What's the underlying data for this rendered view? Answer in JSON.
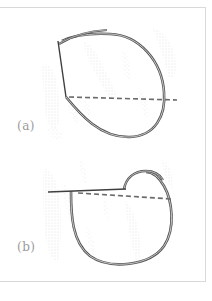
{
  "figure": {
    "panels": [
      {
        "id": "a",
        "label": "(a)",
        "description": "Open loop with straight vertical segment and horizontal dashed reference line"
      },
      {
        "id": "b",
        "label": "(b)",
        "description": "Closed loop with horizontal solid segment, small upper hook, and dashed reference line"
      }
    ],
    "colors": {
      "curve_stroke": "#555555",
      "curve_highlight": "#cfcfcf",
      "dashed_line": "#6b6b6b",
      "stipple": "#c8c8c8",
      "frame": "#d9d9d9",
      "label_text": "#9a9a9a",
      "background": "#ffffff"
    }
  }
}
